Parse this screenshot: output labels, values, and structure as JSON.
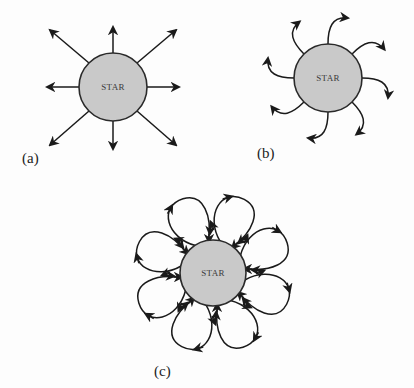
{
  "figure": {
    "panels": [
      {
        "id": "a",
        "label": "(a)",
        "star_label": "STAR",
        "description": "Straight radial arrows pointing outward from star (8 directions)",
        "arrow_count": 8
      },
      {
        "id": "b",
        "label": "(b)",
        "star_label": "STAR",
        "description": "Curved arrows emanating outward from star, bending clockwise (8 arrows)",
        "arrow_count": 8
      },
      {
        "id": "c",
        "label": "(c)",
        "star_label": "STAR",
        "description": "Closed loops (petals) leaving and returning to the star surface with circulation arrows (8 loops)",
        "loop_count": 8
      }
    ],
    "colors": {
      "star_fill": "#c9c9c9",
      "stroke": "#1a1a1a",
      "background": "#fdfdfd"
    }
  }
}
